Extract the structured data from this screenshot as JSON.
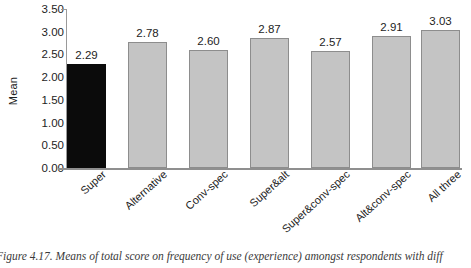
{
  "figure": {
    "caption": "Figure 4.17. Means of total score on frequency of use (experience) amongst respondents with diff"
  },
  "chart_data": {
    "type": "bar",
    "title": "",
    "xlabel": "",
    "ylabel": "Mean",
    "ylim": [
      0.0,
      3.5
    ],
    "ytick_labels": [
      "3.50",
      "3.00",
      "2.50",
      "2.00",
      "1.50",
      "1.00",
      "0.50",
      "0.00"
    ],
    "ytick_values": [
      3.5,
      3.0,
      2.5,
      2.0,
      1.5,
      1.0,
      0.5,
      0.0
    ],
    "grid": false,
    "legend": "none",
    "categories": [
      "Super",
      "Alternative",
      "Conv-spec",
      "Super&alt",
      "Super&conv-spec",
      "Alt&conv-spec",
      "All three"
    ],
    "values": [
      2.29,
      2.78,
      2.6,
      2.87,
      2.57,
      2.91,
      3.03
    ],
    "value_labels": [
      "2.29",
      "2.78",
      "2.60",
      "2.87",
      "2.57",
      "2.91",
      "3.03"
    ],
    "bar_colors": [
      "#0b0b0b",
      "#c4c4c4",
      "#c4c4c4",
      "#c4c4c4",
      "#c4c4c4",
      "#c4c4c4",
      "#c4c4c4"
    ],
    "highlight_index": 0,
    "bar_border_color": "#8d8d8d",
    "axis_color": "#8f8f8f"
  }
}
